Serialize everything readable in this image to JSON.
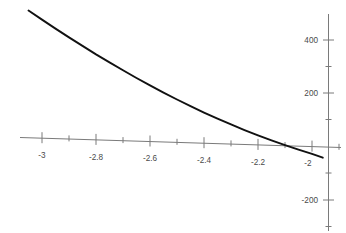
{
  "chart_data": {
    "type": "line",
    "title": "",
    "subtitle": "",
    "xlabel": "",
    "ylabel": "",
    "xlim": [
      -3.08,
      -1.945
    ],
    "ylim": [
      -280,
      520
    ],
    "grid": false,
    "legend": null,
    "axes_style": "cartesian-crosshair",
    "x_axis": {
      "major_ticks": [
        -3,
        -2.8,
        -2.6,
        -2.4,
        -2.2,
        -2
      ],
      "major_tick_labels": [
        "-3",
        "-2.8",
        "-2.6",
        "-2.4",
        "-2.2",
        "-2"
      ],
      "minor_ticks": [
        -2.9,
        -2.7,
        -2.5,
        -2.3,
        -2.1
      ],
      "axis_position_y": 0
    },
    "y_axis": {
      "major_ticks": [
        400,
        200,
        -200
      ],
      "major_tick_labels": [
        "400",
        "200",
        "-200"
      ],
      "minor_ticks": [
        300,
        100,
        -100,
        -250
      ],
      "axis_position_x": -2.0
    },
    "series": [
      {
        "name": "curve",
        "style": "solid",
        "color": "#111111",
        "x": [
          -3.05,
          -3.0,
          -2.95,
          -2.9,
          -2.85,
          -2.8,
          -2.75,
          -2.7,
          -2.65,
          -2.6,
          -2.55,
          -2.5,
          -2.45,
          -2.4,
          -2.35,
          -2.3,
          -2.25,
          -2.2,
          -2.15,
          -2.1,
          -2.05,
          -2.0,
          -1.96
        ],
        "y": [
          512,
          478,
          444,
          411,
          379,
          347,
          317,
          287,
          258,
          230,
          203,
          177,
          152,
          128,
          105,
          83,
          62,
          42,
          23,
          5,
          -12,
          -28,
          -42
        ]
      }
    ],
    "annotations": [],
    "x_axis_crossing": -2.085,
    "background_color": "#ffffff",
    "axis_color": "#7a7a7a",
    "tick_label_color": "#4a4a4a"
  }
}
